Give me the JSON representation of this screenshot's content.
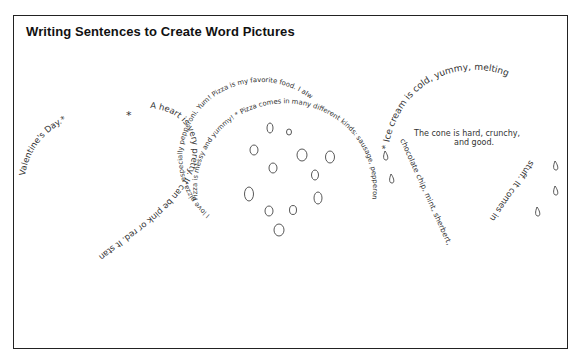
{
  "title": "Writing Sentences to Create Word Pictures",
  "heart": {
    "top_right": "Valentine's Day.* A heart is very pretty. It can be pink or red. It stands for love on",
    "part_a": "Valentine's Day.*",
    "part_b": "A heart is very pretty. It can be pink or red. It stands for love on"
  },
  "pizza": {
    "outer": "Pizza is messy and yummy! * Pizza comes in many different kinds: sausage, pepperoni, cheese, hamburger, combination.",
    "inner": "I love pizza, especially pepperoni. Yum! Pizza is my favorite food. I always want to eat it."
  },
  "ice_cream": {
    "scoop": "* Ice cream is cold, yummy, melting",
    "right": "stuff. It comes in",
    "left": "chocolate chip, mint, sherbert,",
    "cone_line1": "The cone is hard, crunchy,",
    "cone_line2": "and good."
  },
  "colors": {
    "ink": "#333333",
    "frame": "#222222"
  }
}
